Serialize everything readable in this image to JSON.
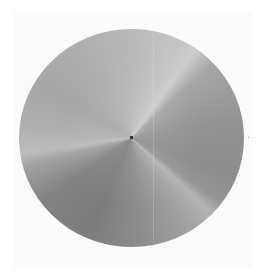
{
  "image": {
    "description": "Grayscale disc with conic shading and three light ridges converging at a center dot",
    "shape": "circle",
    "center_px": [
      131,
      137
    ],
    "radius_px": 112,
    "background_color": "#ffffff",
    "center_dot_color": "#3a3a3a",
    "tones": {
      "upper_left": "#aeaeae",
      "upper_right_ridge": "#cdcdcd",
      "right": "#8d8d8d",
      "lower_right_ridge": "#b4b4b4",
      "bottom": "#7c7c7c",
      "left_ridge": "#bcbcbc"
    }
  }
}
